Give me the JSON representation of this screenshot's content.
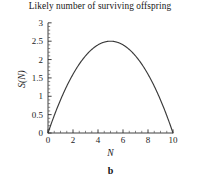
{
  "chart_data": {
    "type": "line",
    "title": "Likely number of surviving offspring",
    "xlabel": "N",
    "ylabel": "S(N)",
    "panel_label": "b",
    "xlim": [
      0,
      10.4
    ],
    "ylim": [
      0,
      3.05
    ],
    "grid": false,
    "legend": null,
    "x_ticks": [
      "0",
      "2",
      "4",
      "6",
      "8",
      "10"
    ],
    "x_tick_values": [
      0,
      2,
      4,
      6,
      8,
      10
    ],
    "x_minor_interval": 0.5,
    "y_ticks": [
      "0",
      "0.5",
      "1",
      "1.5",
      "2",
      "2.5",
      "3"
    ],
    "y_tick_values": [
      0,
      0.5,
      1,
      1.5,
      2,
      2.5,
      3
    ],
    "y_minor_interval": 0.1,
    "series": [
      {
        "name": "S(N)",
        "formula": "0.1 * N * (10 - N)",
        "x": [
          0,
          0.5,
          1,
          1.5,
          2,
          2.5,
          3,
          3.5,
          4,
          4.5,
          5,
          5.5,
          6,
          6.5,
          7,
          7.5,
          8,
          8.5,
          9,
          9.5,
          10
        ],
        "values": [
          0,
          0.475,
          0.9,
          1.275,
          1.6,
          1.875,
          2.1,
          2.275,
          2.4,
          2.475,
          2.5,
          2.475,
          2.4,
          2.275,
          2.1,
          1.875,
          1.6,
          1.275,
          0.9,
          0.475,
          0
        ],
        "peak": {
          "x": 5,
          "y": 2.5
        },
        "color": "#3a3a3a"
      }
    ]
  },
  "colors": {
    "background": "#ffffff",
    "axis": "#2a2a2a",
    "curve": "#3a3a3a",
    "text": "#161616"
  }
}
